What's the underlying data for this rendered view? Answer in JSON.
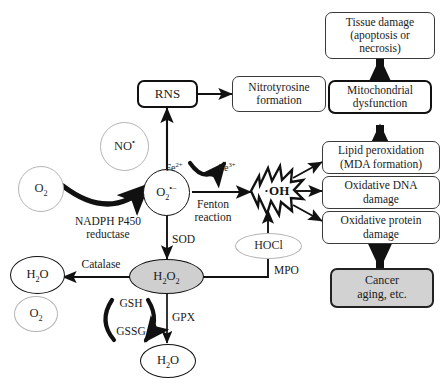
{
  "diagram": {
    "colors": {
      "stroke_dark": "#111111",
      "stroke_mid": "#3a3a3a",
      "stroke_light": "#b4b4b4",
      "fill_gray": "#d2d2d2",
      "fill_oval_gray": "#cfcfcf",
      "background": "#ffffff"
    },
    "boxes": [
      {
        "id": "rns",
        "label": "RNS",
        "style": "thick"
      },
      {
        "id": "nitrotyrosine",
        "label": "Nitrotyrosine\nformation",
        "style": "thin"
      },
      {
        "id": "tissue_damage",
        "label": "Tissue damage\n(apoptosis or\nnecrosis)",
        "style": "thin"
      },
      {
        "id": "mito_dysfunction",
        "label": "Mitochondrial\ndysfunction",
        "style": "thick"
      },
      {
        "id": "lipid_perox",
        "label": "Lipid peroxidation\n(MDA formation)",
        "style": "thin"
      },
      {
        "id": "oxidative_dna",
        "label": "Oxidative DNA\ndamage",
        "style": "thin"
      },
      {
        "id": "oxidative_protein",
        "label": "Oxidative protein\ndamage",
        "style": "thin"
      },
      {
        "id": "cancer",
        "label": "Cancer\naging, etc.",
        "style": "gray"
      }
    ],
    "ovals": [
      {
        "id": "no_radical",
        "label": "NO",
        "superscript": "•",
        "style": "gray-outline"
      },
      {
        "id": "o2_left",
        "label": "O",
        "subscript": "2",
        "style": "gray-outline"
      },
      {
        "id": "superoxide",
        "label": "O",
        "subscript": "2",
        "superscript": "•−",
        "style": "black-outline"
      },
      {
        "id": "h2o_left",
        "label": "H",
        "subscript": "2",
        "label2": "O",
        "style": "black-outline"
      },
      {
        "id": "o2_lower_left",
        "label": "O",
        "subscript": "2",
        "style": "gray-outline"
      },
      {
        "id": "h2o2",
        "label": "H",
        "subscript": "2",
        "label2": "O",
        "subscript2": "2",
        "style": "gray-filled"
      },
      {
        "id": "h2o_bottom",
        "label": "H",
        "subscript": "2",
        "label2": "O",
        "style": "black-outline"
      },
      {
        "id": "hocl",
        "label": "HOCl",
        "style": "gray-outline"
      }
    ],
    "burst": {
      "id": "hydroxyl_radical",
      "label": "·OH"
    },
    "edge_labels": [
      {
        "id": "fe2",
        "text": "Fe",
        "sup": "2+"
      },
      {
        "id": "fe3",
        "text": "Fe",
        "sup": "3+"
      },
      {
        "id": "fenton",
        "text": "Fenton\nreaction"
      },
      {
        "id": "nadph",
        "text": "NADPH P450\nreductase"
      },
      {
        "id": "sod",
        "text": "SOD"
      },
      {
        "id": "catalase",
        "text": "Catalase"
      },
      {
        "id": "gsh",
        "text": "GSH"
      },
      {
        "id": "gssg",
        "text": "GSSG"
      },
      {
        "id": "gpx",
        "text": "GPX"
      },
      {
        "id": "mpo",
        "text": "MPO"
      }
    ]
  }
}
